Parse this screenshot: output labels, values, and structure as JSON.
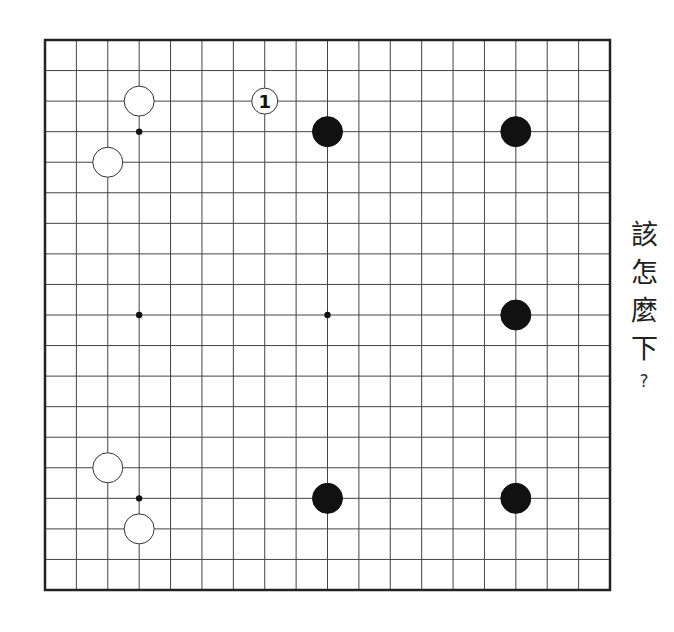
{
  "board": {
    "size": 19,
    "left": 45,
    "top": 40,
    "right": 610,
    "bottom": 590,
    "line_color": "#444444",
    "border_color": "#222222",
    "star_points": [
      [
        3,
        3
      ],
      [
        9,
        3
      ],
      [
        15,
        3
      ],
      [
        3,
        9
      ],
      [
        9,
        9
      ],
      [
        15,
        9
      ],
      [
        3,
        15
      ],
      [
        9,
        15
      ],
      [
        15,
        15
      ]
    ],
    "visible_star_points": [
      [
        3,
        3
      ],
      [
        3,
        9
      ],
      [
        9,
        9
      ],
      [
        3,
        15
      ]
    ],
    "stones": [
      {
        "color": "white",
        "col": 3,
        "row": 2
      },
      {
        "color": "white",
        "col": 2,
        "row": 4
      },
      {
        "color": "white",
        "col": 2,
        "row": 14
      },
      {
        "color": "white",
        "col": 3,
        "row": 16
      },
      {
        "color": "black",
        "col": 9,
        "row": 3
      },
      {
        "color": "black",
        "col": 15,
        "row": 3
      },
      {
        "color": "black",
        "col": 15,
        "row": 9
      },
      {
        "color": "black",
        "col": 9,
        "row": 15
      },
      {
        "color": "black",
        "col": 15,
        "row": 15
      }
    ],
    "numbered_moves": [
      {
        "label": "1",
        "color": "white",
        "col": 7,
        "row": 2
      }
    ]
  },
  "prompt": {
    "chars": [
      "該",
      "怎",
      "麼",
      "下"
    ],
    "question_mark": "?"
  }
}
